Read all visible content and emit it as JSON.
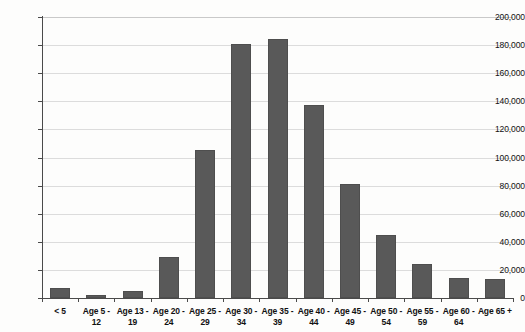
{
  "chart_data": {
    "type": "bar",
    "title": "",
    "xlabel": "",
    "ylabel": "",
    "ylim": [
      0,
      200000
    ],
    "grid": true,
    "legend": "none",
    "bar_color": "#595959",
    "categories": [
      "< 5",
      "Age 5 - 12",
      "Age 13 - 19",
      "Age 20 - 24",
      "Age 25 - 29",
      "Age 30 - 34",
      "Age 35 - 39",
      "Age 40 - 44",
      "Age 45 - 49",
      "Age 50 - 54",
      "Age 55 - 59",
      "Age 60 - 64",
      "Age 65 +"
    ],
    "category_lines": [
      {
        "line1": "< 5",
        "line2": ""
      },
      {
        "line1": "Age 5 -",
        "line2": "12"
      },
      {
        "line1": "Age 13 -",
        "line2": "19"
      },
      {
        "line1": "Age 20 -",
        "line2": "24"
      },
      {
        "line1": "Age 25 -",
        "line2": "29"
      },
      {
        "line1": "Age 30 -",
        "line2": "34"
      },
      {
        "line1": "Age 35 -",
        "line2": "39"
      },
      {
        "line1": "Age 40 -",
        "line2": "44"
      },
      {
        "line1": "Age 45 -",
        "line2": "49"
      },
      {
        "line1": "Age 50 -",
        "line2": "54"
      },
      {
        "line1": "Age 55 -",
        "line2": "59"
      },
      {
        "line1": "Age 60 -",
        "line2": "64"
      },
      {
        "line1": "Age 65 +",
        "line2": ""
      }
    ],
    "values": [
      7000,
      2500,
      5000,
      29000,
      105500,
      181000,
      184000,
      137500,
      81500,
      44500,
      24500,
      14500,
      13500
    ],
    "ytick_values": [
      0,
      20000,
      40000,
      60000,
      80000,
      100000,
      120000,
      140000,
      160000,
      180000,
      200000
    ],
    "ytick_labels": [
      "0",
      "20,000",
      "40,000",
      "60,000",
      "80,000",
      "100,000",
      "120,000",
      "140,000",
      "160,000",
      "180,000",
      "200,000"
    ]
  }
}
